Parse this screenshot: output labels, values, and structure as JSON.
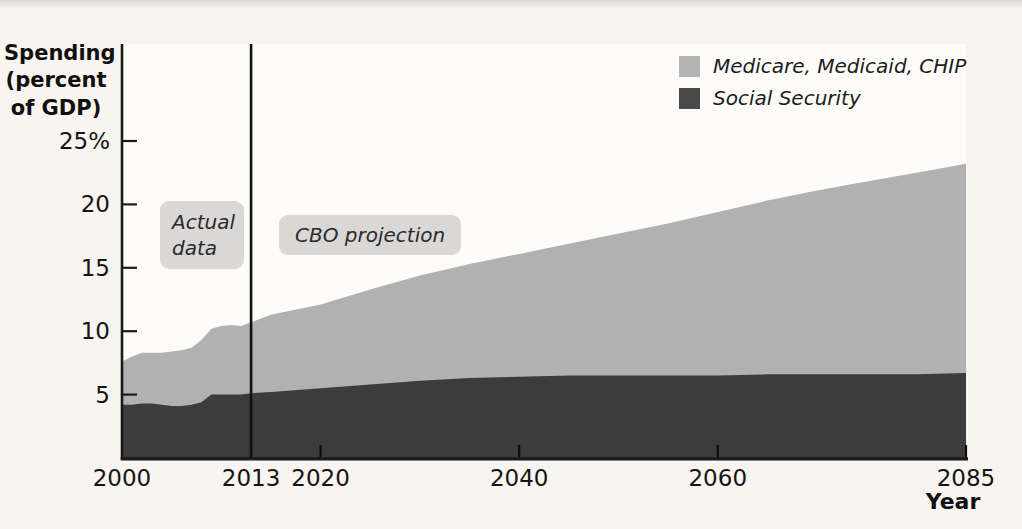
{
  "figure": {
    "y_axis_title_lines": [
      "Spending",
      "(percent",
      "of GDP)"
    ]
  },
  "colors": {
    "page_background": "#f8f4ef",
    "plot_background": "#fdfcf9",
    "axis": "#1a1a1a",
    "divider_line": "#111111",
    "annotation_box": "#d9d8d6",
    "medicare_area": "#b1b1b1",
    "social_security_area": "#3c3c3c"
  },
  "legend": {
    "items": [
      {
        "label": "Medicare, Medicaid, CHIP",
        "color": "#b4b4b4"
      },
      {
        "label": "Social Security",
        "color": "#484848"
      }
    ]
  },
  "chart_data": {
    "type": "area",
    "stacked": true,
    "title": "",
    "xlabel": "Year",
    "ylabel": "Spending (percent of GDP)",
    "xlim": [
      2000,
      2085
    ],
    "ylim": [
      0,
      32.5
    ],
    "grid": false,
    "legend_position": "top-right",
    "divider_year": 2013,
    "annotations": [
      {
        "text": "Actual data",
        "region": "left of 2013 divider"
      },
      {
        "text": "CBO projection",
        "region": "right of 2013 divider"
      }
    ],
    "x_ticks": [
      {
        "v": 2000,
        "label": "2000",
        "mark": false
      },
      {
        "v": 2013,
        "label": "2013",
        "mark": true
      },
      {
        "v": 2020,
        "label": "2020",
        "mark": true
      },
      {
        "v": 2040,
        "label": "2040",
        "mark": true
      },
      {
        "v": 2060,
        "label": "2060",
        "mark": true
      },
      {
        "v": 2085,
        "label": "2085",
        "mark": true
      }
    ],
    "y_ticks": [
      {
        "v": 25,
        "label": "25%"
      },
      {
        "v": 20,
        "label": "20"
      },
      {
        "v": 15,
        "label": "15"
      },
      {
        "v": 10,
        "label": "10"
      },
      {
        "v": 5,
        "label": "5"
      }
    ],
    "x": [
      2000,
      2001,
      2002,
      2003,
      2004,
      2005,
      2006,
      2007,
      2008,
      2009,
      2010,
      2011,
      2012,
      2013,
      2015,
      2020,
      2025,
      2030,
      2035,
      2040,
      2045,
      2050,
      2055,
      2060,
      2065,
      2070,
      2075,
      2080,
      2085
    ],
    "series": [
      {
        "name": "Social Security",
        "color": "#3c3c3c",
        "values": [
          4.2,
          4.2,
          4.3,
          4.3,
          4.2,
          4.1,
          4.1,
          4.2,
          4.4,
          5.0,
          5.0,
          5.0,
          5.0,
          5.1,
          5.2,
          5.5,
          5.8,
          6.1,
          6.3,
          6.4,
          6.5,
          6.5,
          6.5,
          6.5,
          6.6,
          6.6,
          6.6,
          6.6,
          6.7
        ]
      },
      {
        "name": "Medicare, Medicaid, CHIP",
        "color": "#b1b1b1",
        "values": [
          3.4,
          3.8,
          4.0,
          4.0,
          4.1,
          4.3,
          4.4,
          4.5,
          4.9,
          5.2,
          5.4,
          5.5,
          5.4,
          5.6,
          6.1,
          6.6,
          7.5,
          8.3,
          9.0,
          9.7,
          10.4,
          11.2,
          12.0,
          12.9,
          13.7,
          14.5,
          15.2,
          15.9,
          16.5
        ]
      }
    ]
  }
}
